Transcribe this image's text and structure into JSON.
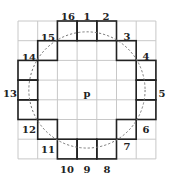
{
  "diagram": {
    "grid": {
      "rows": 7,
      "cols": 7,
      "origin_x": 18,
      "origin_y": 21,
      "cell": 19.7,
      "grid_color": "#c8c8c8",
      "highlight_color": "#222222"
    },
    "center": {
      "label": "p",
      "row": 3,
      "col": 3
    },
    "circle": {
      "style": "dashed",
      "color": "#777777",
      "radius_cells": 2.95
    },
    "pixels": [
      {
        "label": "1",
        "row": 0,
        "col": 3
      },
      {
        "label": "2",
        "row": 0,
        "col": 4
      },
      {
        "label": "3",
        "row": 1,
        "col": 5
      },
      {
        "label": "4",
        "row": 2,
        "col": 6
      },
      {
        "label": "5",
        "row": 3,
        "col": 6
      },
      {
        "label": "6",
        "row": 4,
        "col": 6
      },
      {
        "label": "7",
        "row": 5,
        "col": 5
      },
      {
        "label": "8",
        "row": 6,
        "col": 4
      },
      {
        "label": "9",
        "row": 6,
        "col": 3
      },
      {
        "label": "10",
        "row": 6,
        "col": 2
      },
      {
        "label": "11",
        "row": 5,
        "col": 1
      },
      {
        "label": "12",
        "row": 4,
        "col": 0
      },
      {
        "label": "13",
        "row": 3,
        "col": 0
      },
      {
        "label": "14",
        "row": 2,
        "col": 0
      },
      {
        "label": "15",
        "row": 1,
        "col": 1
      },
      {
        "label": "16",
        "row": 0,
        "col": 2
      }
    ],
    "labels": [
      {
        "text": "16",
        "x": 68,
        "y": 20
      },
      {
        "text": "1",
        "x": 87,
        "y": 20
      },
      {
        "text": "2",
        "x": 106,
        "y": 20
      },
      {
        "text": "3",
        "x": 127,
        "y": 40
      },
      {
        "text": "4",
        "x": 146,
        "y": 60
      },
      {
        "text": "5",
        "x": 162,
        "y": 97
      },
      {
        "text": "6",
        "x": 146,
        "y": 133
      },
      {
        "text": "7",
        "x": 127,
        "y": 150
      },
      {
        "text": "8",
        "x": 107,
        "y": 173
      },
      {
        "text": "9",
        "x": 87,
        "y": 173
      },
      {
        "text": "10",
        "x": 67,
        "y": 173
      },
      {
        "text": "11",
        "x": 48,
        "y": 153
      },
      {
        "text": "12",
        "x": 29,
        "y": 133
      },
      {
        "text": "13",
        "x": 10,
        "y": 97
      },
      {
        "text": "14",
        "x": 29,
        "y": 61
      },
      {
        "text": "15",
        "x": 48,
        "y": 41
      },
      {
        "text": "p",
        "x": 87,
        "y": 97
      }
    ]
  }
}
